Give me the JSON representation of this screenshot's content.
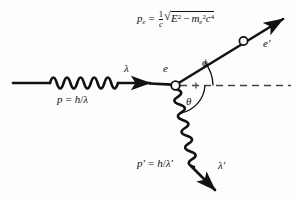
{
  "figure": {
    "background_color": "#fdfdfd",
    "ink_color": "#111111",
    "dashed_color": "#555555"
  },
  "labels": {
    "incoming_photon_wavelength": "λ",
    "incoming_photon_momentum_p": "p",
    "incoming_photon_momentum_eq": "=",
    "incoming_photon_momentum_h": "h",
    "incoming_photon_momentum_slash": "/",
    "incoming_photon_momentum_lambda": "λ",
    "electron_vertex": "e",
    "scattered_electron": "e",
    "scattered_electron_prime": "′",
    "scattered_photon_wavelength": "λ",
    "scattered_photon_wavelength_prime": "′",
    "scattered_photon_momentum_p": "p",
    "scattered_photon_momentum_prime": "′",
    "scattered_photon_momentum_eq": "=",
    "scattered_photon_momentum_h": "h",
    "scattered_photon_momentum_slash": "/",
    "scattered_photon_momentum_lambda": "λ",
    "scattered_photon_momentum_lambda_prime": "′",
    "angle_phi": "ϕ",
    "angle_theta": "θ"
  },
  "formula": {
    "lhs_p": "p",
    "lhs_sub": "e",
    "equals": "=",
    "frac_numerator": "1",
    "frac_denominator": "c",
    "radical_sign": "√",
    "E": "E",
    "E_exp": "2",
    "minus": "−",
    "m": "m",
    "m_sub": "e",
    "m_exp": "2",
    "c": "c",
    "c_exp": "4",
    "plain_text": "p_e = (1/c) √(E² − m_e²c⁴)"
  },
  "geometry": {
    "vertex": {
      "x": 175,
      "y": 85
    },
    "incoming_photon": {
      "start_x": 13,
      "end_x": 150,
      "y": 83,
      "wave_cycles": 5
    },
    "scattered_electron": {
      "from_x": 175,
      "from_y": 85,
      "to_x": 285,
      "to_y": 18,
      "angle_label": "ϕ"
    },
    "scattered_photon": {
      "from_x": 175,
      "from_y": 88,
      "to_x": 218,
      "to_y": 188,
      "angle_label": "θ",
      "wave_cycles": 5
    },
    "dashed_axis": {
      "from_x": 175,
      "to_x": 290,
      "y": 85
    },
    "vertex_circle_radius": 4,
    "electron_circle": {
      "x": 243,
      "y": 40,
      "r": 4
    }
  }
}
